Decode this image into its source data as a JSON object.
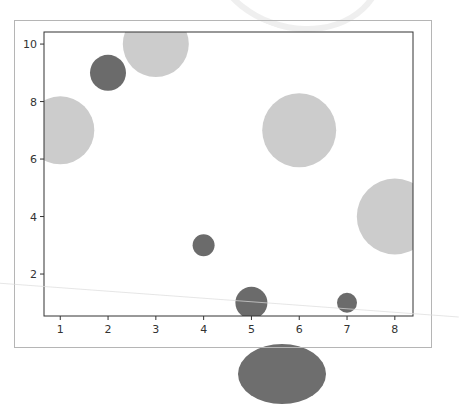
{
  "chart_data": {
    "type": "scatter",
    "title": "",
    "xlabel": "",
    "ylabel": "",
    "xlim": [
      0.66,
      8.38
    ],
    "ylim": [
      0.54,
      10.42
    ],
    "grid": false,
    "legend": null,
    "x_ticks": [
      "1",
      "2",
      "3",
      "4",
      "5",
      "6",
      "7",
      "8"
    ],
    "y_ticks": [
      "2",
      "4",
      "6",
      "8",
      "10"
    ],
    "colors": {
      "dark": "#6b6b6b",
      "light": "#cccccc"
    },
    "points": [
      {
        "x": 1,
        "y": 7,
        "color": "light",
        "radius_px": 34
      },
      {
        "x": 2,
        "y": 9,
        "color": "dark",
        "radius_px": 18
      },
      {
        "x": 3,
        "y": 10,
        "color": "light",
        "radius_px": 33
      },
      {
        "x": 4,
        "y": 3,
        "color": "dark",
        "radius_px": 11
      },
      {
        "x": 5,
        "y": 1,
        "color": "dark",
        "radius_px": 16
      },
      {
        "x": 6,
        "y": 7,
        "color": "light",
        "radius_px": 37
      },
      {
        "x": 7,
        "y": 1,
        "color": "dark",
        "radius_px": 10
      },
      {
        "x": 8,
        "y": 4,
        "color": "light",
        "radius_px": 38
      }
    ]
  }
}
